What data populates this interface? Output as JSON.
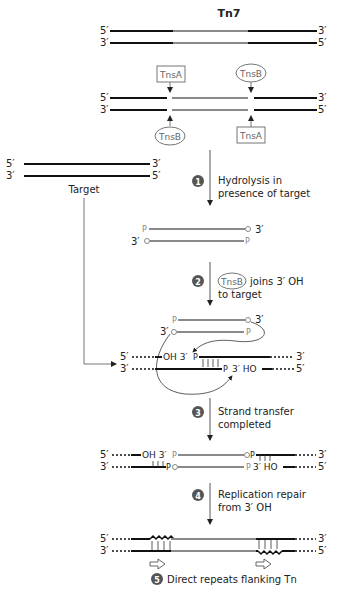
{
  "title": "Tn7",
  "colors": {
    "host_dna": "#111111",
    "transposon_dna": "#8a8a8a",
    "arrow": "#555555",
    "step_badge": "#555555"
  },
  "labels": {
    "five_prime": "5′",
    "three_prime": "3′",
    "tnsA": "TnsA",
    "tnsB": "TnsB",
    "target": "Target",
    "p": "P",
    "oh3": "OH 3′",
    "ho3": "3′ HO"
  },
  "steps": [
    {
      "num": "1",
      "line1": "Hydrolysis in",
      "line2": "presence of target"
    },
    {
      "num": "2",
      "protein": "TnsB",
      "line1": "joins 3′ OH",
      "line2": "to target"
    },
    {
      "num": "3",
      "line1": "Strand transfer",
      "line2": "completed"
    },
    {
      "num": "4",
      "line1": "Replication repair",
      "line2": "from 3′ OH"
    },
    {
      "num": "5",
      "line1": "Direct repeats flanking Tn"
    }
  ]
}
